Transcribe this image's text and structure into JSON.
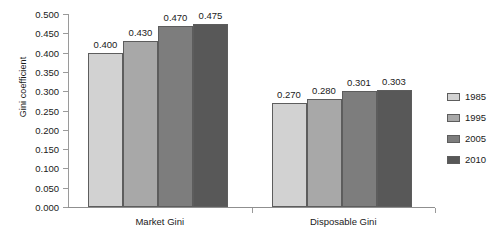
{
  "chart_data": {
    "type": "bar",
    "title": "",
    "subtitle": "",
    "xlabel": "",
    "ylabel": "Gini coefficient",
    "categories": [
      "Market Gini",
      "Disposable Gini"
    ],
    "series": [
      {
        "name": "1985",
        "values": [
          0.4,
          0.27
        ],
        "labels": [
          "0.400",
          "0.270"
        ],
        "color": "#d2d2d2"
      },
      {
        "name": "1995",
        "values": [
          0.43,
          0.28
        ],
        "labels": [
          "0.430",
          "0.280"
        ],
        "color": "#a8a8a8"
      },
      {
        "name": "2005",
        "values": [
          0.47,
          0.301
        ],
        "labels": [
          "0.470",
          "0.301"
        ],
        "color": "#7d7d7d"
      },
      {
        "name": "2010",
        "values": [
          0.475,
          0.303
        ],
        "labels": [
          "0.475",
          "0.303"
        ],
        "color": "#585858"
      }
    ],
    "ylim": [
      0.0,
      0.5
    ],
    "ytick_values": [
      0.5,
      0.45,
      0.4,
      0.35,
      0.3,
      0.25,
      0.2,
      0.15,
      0.1,
      0.05,
      0.0
    ],
    "ytick_labels": [
      "0.500",
      "0.450",
      "0.400",
      "0.350",
      "0.300",
      "0.250",
      "0.200",
      "0.150",
      "0.100",
      "0.050",
      "0.000"
    ],
    "grid": false,
    "legend_position": "right",
    "legend_entries": [
      "1985",
      "1995",
      "2005",
      "2010"
    ],
    "data_labels_shown": true
  },
  "axis": {
    "y_title": "Gini coefficient"
  },
  "legend": {
    "entries": [
      {
        "label": "1985"
      },
      {
        "label": "1995"
      },
      {
        "label": "2005"
      },
      {
        "label": "2010"
      }
    ]
  }
}
